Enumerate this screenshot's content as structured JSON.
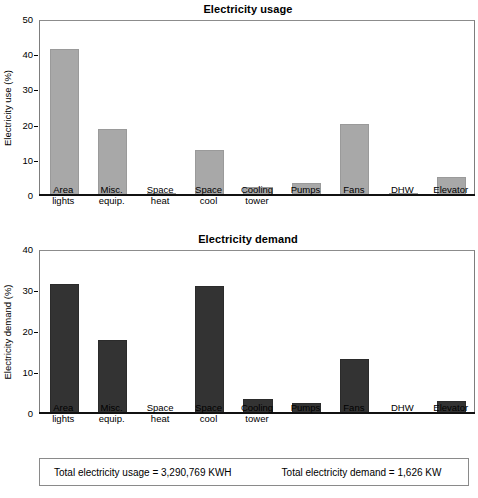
{
  "figure": {
    "footer": {
      "total_usage": "Total electricity usage = 3,290,769 KWH",
      "total_demand": "Total electricity demand = 1,626 KW"
    }
  },
  "chart_data": [
    {
      "type": "bar",
      "id": "electricity-usage",
      "title": "Electricity usage",
      "xlabel": "",
      "ylabel": "Electricity use (%)",
      "ylim": [
        0,
        50
      ],
      "yticks": [
        0,
        10,
        20,
        30,
        40,
        50
      ],
      "grid": false,
      "legend": "none",
      "bar_color": "#a8a8a8",
      "categories": [
        "Area\nlights",
        "Misc.\nequip.",
        "Space\nheat",
        "Space\ncool",
        "Cooling\ntower",
        "Pumps",
        "Fans",
        "DHW",
        "Elevator"
      ],
      "values": [
        41.5,
        18.7,
        0.7,
        12.7,
        2.2,
        3.3,
        20.2,
        0.3,
        5.2
      ]
    },
    {
      "type": "bar",
      "id": "electricity-demand",
      "title": "Electricity demand",
      "xlabel": "",
      "ylabel": "Electricity demand (%)",
      "ylim": [
        0,
        40
      ],
      "yticks": [
        0,
        10,
        20,
        30,
        40
      ],
      "grid": false,
      "legend": "none",
      "bar_color": "#333333",
      "categories": [
        "Area\nlights",
        "Misc.\nequip.",
        "Space\nheat",
        "Space\ncool",
        "Cooling\ntower",
        "Pumps",
        "Fans",
        "DHW",
        "Elevator"
      ],
      "values": [
        31.5,
        17.8,
        0.0,
        31.0,
        3.4,
        2.4,
        13.2,
        0.0,
        2.9
      ]
    }
  ]
}
